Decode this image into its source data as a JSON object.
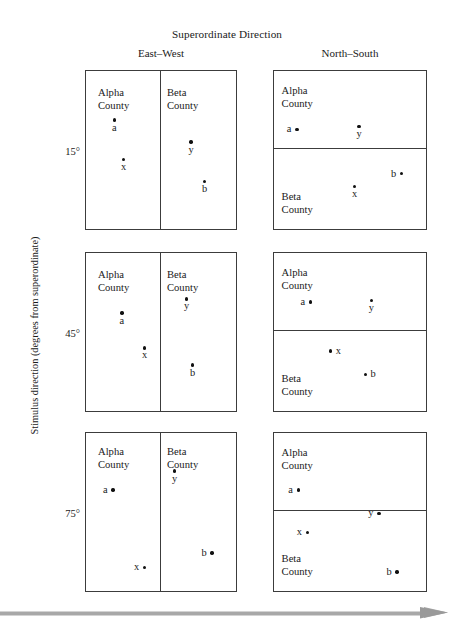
{
  "figure": {
    "title": "Superordinate Direction",
    "y_axis_label": "Stimulus direction (degrees from superordinate)",
    "columns": [
      {
        "key": "east_west",
        "label": "East–West"
      },
      {
        "key": "north_south",
        "label": "North–South"
      }
    ],
    "row_ticks": [
      "15°",
      "45°",
      "75°"
    ],
    "county_names": {
      "alpha": "Alpha\nCounty",
      "beta": "Beta\nCounty"
    },
    "point_labels": [
      "a",
      "x",
      "y",
      "b"
    ],
    "colors": {
      "stroke": "#3c3c3c",
      "point": "#111111",
      "text": "#1a1a1a",
      "arrow": "#a8a8a8",
      "background": "#ffffff"
    }
  },
  "panels": {
    "ew_15": {
      "column": "East–West",
      "row": "15°",
      "split": "vertical",
      "left_region": {
        "alpha_line1": "Alpha",
        "alpha_line2": "County"
      },
      "right_region": {
        "beta_line1": "Beta",
        "beta_line2": "County"
      },
      "points": [
        {
          "label": "a",
          "x_pct": 19,
          "y_pct": 31
        },
        {
          "label": "x",
          "x_pct": 25,
          "y_pct": 56
        },
        {
          "label": "y",
          "x_pct": 70,
          "y_pct": 45
        },
        {
          "label": "b",
          "x_pct": 79,
          "y_pct": 70
        }
      ]
    },
    "ns_15": {
      "column": "North–South",
      "row": "15°",
      "split": "horizontal",
      "top_region": {
        "alpha_line1": "Alpha",
        "alpha_line2": "County"
      },
      "bottom_region": {
        "beta_line1": "Beta",
        "beta_line2": "County"
      },
      "points": [
        {
          "label": "a",
          "x_pct": 15,
          "y_pct": 37
        },
        {
          "label": "y",
          "x_pct": 56,
          "y_pct": 35
        },
        {
          "label": "b",
          "x_pct": 84,
          "y_pct": 65
        },
        {
          "label": "x",
          "x_pct": 53,
          "y_pct": 73
        }
      ]
    },
    "ew_45": {
      "column": "East–West",
      "row": "45°",
      "split": "vertical",
      "left_region": {
        "alpha_line1": "Alpha",
        "alpha_line2": "County"
      },
      "right_region": {
        "beta_line1": "Beta",
        "beta_line2": "County"
      },
      "points": [
        {
          "label": "a",
          "x_pct": 24,
          "y_pct": 38
        },
        {
          "label": "x",
          "x_pct": 39,
          "y_pct": 60
        },
        {
          "label": "y",
          "x_pct": 67,
          "y_pct": 29
        },
        {
          "label": "b",
          "x_pct": 71,
          "y_pct": 71
        }
      ]
    },
    "ns_45": {
      "column": "North–South",
      "row": "45°",
      "split": "horizontal",
      "top_region": {
        "alpha_line1": "Alpha",
        "alpha_line2": "County"
      },
      "bottom_region": {
        "beta_line1": "Beta",
        "beta_line2": "County"
      },
      "points": [
        {
          "label": "a",
          "x_pct": 24,
          "y_pct": 31
        },
        {
          "label": "y",
          "x_pct": 64,
          "y_pct": 30
        },
        {
          "label": "x",
          "x_pct": 37,
          "y_pct": 62
        },
        {
          "label": "b",
          "x_pct": 60,
          "y_pct": 77
        }
      ]
    },
    "ew_75": {
      "column": "East–West",
      "row": "75°",
      "split": "vertical",
      "left_region": {
        "alpha_line1": "Alpha",
        "alpha_line2": "County"
      },
      "right_region": {
        "beta_line1": "Beta",
        "beta_line2": "County"
      },
      "points": [
        {
          "label": "a",
          "x_pct": 18,
          "y_pct": 36
        },
        {
          "label": "x",
          "x_pct": 39,
          "y_pct": 85
        },
        {
          "label": "y",
          "x_pct": 59,
          "y_pct": 24
        },
        {
          "label": "b",
          "x_pct": 84,
          "y_pct": 76
        }
      ]
    },
    "ns_75": {
      "column": "North–South",
      "row": "75°",
      "split": "horizontal",
      "top_region": {
        "alpha_line1": "Alpha",
        "alpha_line2": "County"
      },
      "bottom_region": {
        "beta_line1": "Beta",
        "beta_line2": "County"
      },
      "points": [
        {
          "label": "a",
          "x_pct": 16,
          "y_pct": 36
        },
        {
          "label": "y",
          "x_pct": 69,
          "y_pct": 51
        },
        {
          "label": "x",
          "x_pct": 22,
          "y_pct": 63
        },
        {
          "label": "b",
          "x_pct": 81,
          "y_pct": 88
        }
      ]
    }
  },
  "chart_data": {
    "type": "scatter",
    "title": "Superordinate Direction",
    "xlabel": "Superordinate Direction",
    "ylabel": "Stimulus direction (degrees from superordinate)",
    "grid": false,
    "legend": "none",
    "facet_columns": [
      "East–West",
      "North–South"
    ],
    "facet_rows": [
      "15°",
      "45°",
      "75°"
    ],
    "region_labels": [
      "Alpha County",
      "Beta County"
    ],
    "xlim": [
      0,
      100
    ],
    "ylim": [
      0,
      100
    ],
    "note": "x/y values are percent of panel width and height; y increases downward from the panel top edge.",
    "facets": [
      {
        "column": "East–West",
        "row": "15°",
        "split": "vertical",
        "split_at_pct": 49,
        "regions": [
          {
            "name": "Alpha County",
            "side": "left",
            "label_pos": [
              8,
              10
            ]
          },
          {
            "name": "Beta County",
            "side": "right",
            "label_pos": [
              54,
              10
            ]
          }
        ],
        "points": [
          {
            "name": "a",
            "x": 19,
            "y": 31,
            "label_placement": "below"
          },
          {
            "name": "x",
            "x": 25,
            "y": 56,
            "label_placement": "below"
          },
          {
            "name": "y",
            "x": 70,
            "y": 45,
            "label_placement": "below"
          },
          {
            "name": "b",
            "x": 79,
            "y": 70,
            "label_placement": "below"
          }
        ]
      },
      {
        "column": "North–South",
        "row": "15°",
        "split": "horizontal",
        "split_at_pct": 49,
        "regions": [
          {
            "name": "Alpha County",
            "side": "top",
            "label_pos": [
              5,
              9
            ]
          },
          {
            "name": "Beta County",
            "side": "bottom",
            "label_pos": [
              5,
              76
            ]
          }
        ],
        "points": [
          {
            "name": "a",
            "x": 15,
            "y": 37,
            "label_placement": "left"
          },
          {
            "name": "y",
            "x": 56,
            "y": 35,
            "label_placement": "below"
          },
          {
            "name": "b",
            "x": 84,
            "y": 65,
            "label_placement": "left"
          },
          {
            "name": "x",
            "x": 53,
            "y": 73,
            "label_placement": "below"
          }
        ]
      },
      {
        "column": "East–West",
        "row": "45°",
        "split": "vertical",
        "split_at_pct": 49,
        "regions": [
          {
            "name": "Alpha County",
            "side": "left",
            "label_pos": [
              8,
              10
            ]
          },
          {
            "name": "Beta County",
            "side": "right",
            "label_pos": [
              54,
              10
            ]
          }
        ],
        "points": [
          {
            "name": "a",
            "x": 24,
            "y": 38,
            "label_placement": "below"
          },
          {
            "name": "x",
            "x": 39,
            "y": 60,
            "label_placement": "below"
          },
          {
            "name": "y",
            "x": 67,
            "y": 29,
            "label_placement": "below"
          },
          {
            "name": "b",
            "x": 71,
            "y": 71,
            "label_placement": "below"
          }
        ]
      },
      {
        "column": "North–South",
        "row": "45°",
        "split": "horizontal",
        "split_at_pct": 49,
        "regions": [
          {
            "name": "Alpha County",
            "side": "top",
            "label_pos": [
              5,
              9
            ]
          },
          {
            "name": "Beta County",
            "side": "bottom",
            "label_pos": [
              5,
              76
            ]
          }
        ],
        "points": [
          {
            "name": "a",
            "x": 24,
            "y": 31,
            "label_placement": "left"
          },
          {
            "name": "y",
            "x": 64,
            "y": 30,
            "label_placement": "below"
          },
          {
            "name": "x",
            "x": 37,
            "y": 62,
            "label_placement": "right"
          },
          {
            "name": "b",
            "x": 60,
            "y": 77,
            "label_placement": "right"
          }
        ]
      },
      {
        "column": "East–West",
        "row": "75°",
        "split": "vertical",
        "split_at_pct": 49,
        "regions": [
          {
            "name": "Alpha County",
            "side": "left",
            "label_pos": [
              8,
              8
            ]
          },
          {
            "name": "Beta County",
            "side": "right",
            "label_pos": [
              54,
              8
            ]
          }
        ],
        "points": [
          {
            "name": "a",
            "x": 18,
            "y": 36,
            "label_placement": "left"
          },
          {
            "name": "x",
            "x": 39,
            "y": 85,
            "label_placement": "left"
          },
          {
            "name": "y",
            "x": 59,
            "y": 24,
            "label_placement": "below"
          },
          {
            "name": "b",
            "x": 84,
            "y": 76,
            "label_placement": "left"
          }
        ]
      },
      {
        "column": "North–South",
        "row": "75°",
        "split": "horizontal",
        "split_at_pct": 49,
        "regions": [
          {
            "name": "Alpha County",
            "side": "top",
            "label_pos": [
              5,
              9
            ]
          },
          {
            "name": "Beta County",
            "side": "bottom",
            "label_pos": [
              5,
              76
            ]
          }
        ],
        "points": [
          {
            "name": "a",
            "x": 16,
            "y": 36,
            "label_placement": "left"
          },
          {
            "name": "y",
            "x": 69,
            "y": 51,
            "label_placement": "left"
          },
          {
            "name": "x",
            "x": 22,
            "y": 63,
            "label_placement": "left"
          },
          {
            "name": "b",
            "x": 81,
            "y": 88,
            "label_placement": "left"
          }
        ]
      }
    ]
  }
}
